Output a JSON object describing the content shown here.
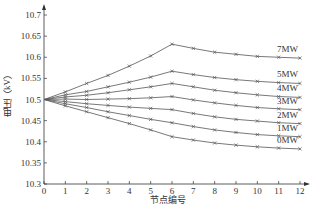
{
  "chart_data": {
    "type": "line",
    "title": "",
    "xlabel": "节点编号",
    "ylabel": "电压（kV）",
    "x": [
      0,
      1,
      2,
      3,
      4,
      5,
      6,
      7,
      8,
      9,
      10,
      11,
      12
    ],
    "xlim": [
      0,
      12
    ],
    "ylim": [
      10.3,
      10.7
    ],
    "yticks": [
      10.3,
      10.35,
      10.4,
      10.45,
      10.5,
      10.55,
      10.6,
      10.65,
      10.7
    ],
    "xticks": [
      0,
      1,
      2,
      3,
      4,
      5,
      6,
      7,
      8,
      9,
      10,
      11,
      12
    ],
    "grid": false,
    "legend_position": "inline-right",
    "marker": "x",
    "series": [
      {
        "name": "7MW",
        "values": [
          10.5,
          10.518,
          10.538,
          10.557,
          10.579,
          10.603,
          10.631,
          10.621,
          10.612,
          10.607,
          10.602,
          10.6,
          10.598
        ]
      },
      {
        "name": "5MW",
        "values": [
          10.5,
          10.511,
          10.519,
          10.53,
          10.541,
          10.553,
          10.567,
          10.559,
          10.552,
          10.547,
          10.543,
          10.54,
          10.538
        ]
      },
      {
        "name": "4MW",
        "values": [
          10.5,
          10.506,
          10.51,
          10.516,
          10.523,
          10.53,
          10.538,
          10.53,
          10.522,
          10.516,
          10.511,
          10.507,
          10.505
        ]
      },
      {
        "name": "3MW",
        "values": [
          10.5,
          10.501,
          10.5,
          10.501,
          10.502,
          10.504,
          10.507,
          10.499,
          10.492,
          10.486,
          10.481,
          10.478,
          10.476
        ]
      },
      {
        "name": "2MW",
        "values": [
          10.5,
          10.495,
          10.49,
          10.486,
          10.482,
          10.479,
          10.476,
          10.467,
          10.459,
          10.453,
          10.449,
          10.445,
          10.443
        ]
      },
      {
        "name": "1MW",
        "values": [
          10.5,
          10.49,
          10.481,
          10.471,
          10.462,
          10.453,
          10.445,
          10.436,
          10.428,
          10.422,
          10.417,
          10.414,
          10.412
        ]
      },
      {
        "name": "0MW",
        "values": [
          10.5,
          10.485,
          10.471,
          10.457,
          10.443,
          10.428,
          10.412,
          10.404,
          10.397,
          10.392,
          10.388,
          10.385,
          10.383
        ]
      }
    ]
  },
  "axes": {
    "xlabel": "节点编号",
    "ylabel": "电压（kV）"
  },
  "colors": {
    "line": "#555555",
    "axis": "#333333"
  }
}
